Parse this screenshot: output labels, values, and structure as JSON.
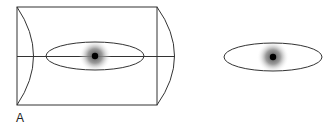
{
  "figure": {
    "panel_label": "A",
    "colors": {
      "stroke": "#333333",
      "dot": "#000000",
      "halo_center": "#555555",
      "background": "#ffffff"
    },
    "left_object": {
      "description": "cylinder with central ellipse cross-section and focal point",
      "box": {
        "x": 17,
        "y": 7,
        "width": 140,
        "height": 98
      },
      "axis_y": 57,
      "left_arc_bulge_x": 33,
      "right_arc_bulge_x": 175,
      "ellipse": {
        "cx": 95,
        "cy": 56,
        "rx": 49,
        "ry": 14
      },
      "dot": {
        "cx": 95,
        "cy": 56,
        "r": 3
      },
      "halo_r": 16
    },
    "right_object": {
      "description": "ellipse with focal point",
      "ellipse": {
        "cx": 273,
        "cy": 57,
        "rx": 49,
        "ry": 14
      },
      "dot": {
        "cx": 273,
        "cy": 57,
        "r": 3
      },
      "halo_r": 16
    }
  }
}
